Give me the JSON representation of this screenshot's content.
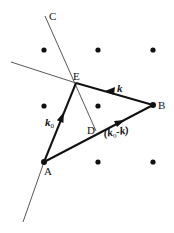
{
  "diagram": {
    "type": "ewald-construction",
    "points": {
      "A": {
        "label": "A",
        "x": 44,
        "y": 162
      },
      "B": {
        "label": "B",
        "x": 153,
        "y": 105
      },
      "C": {
        "label": "C",
        "x": 45,
        "y": 16
      },
      "D": {
        "label": "D",
        "x": 96,
        "y": 131
      },
      "E": {
        "label": "E",
        "x": 76,
        "y": 83
      }
    },
    "lattice_dots": [
      {
        "x": 44,
        "y": 50
      },
      {
        "x": 98,
        "y": 50
      },
      {
        "x": 153,
        "y": 50
      },
      {
        "x": 44,
        "y": 106
      },
      {
        "x": 98,
        "y": 106
      },
      {
        "x": 98,
        "y": 162
      },
      {
        "x": 153,
        "y": 162
      }
    ],
    "vectors": {
      "k0": {
        "label": "k",
        "subscript": "0",
        "from": "A",
        "to": "E"
      },
      "k": {
        "label": "k",
        "from": "B",
        "to": "E"
      },
      "k0_minus_k": {
        "label_open": "(",
        "k0": "k",
        "sub": "o",
        "minus": "-",
        "k": "k",
        "label_close": ")",
        "from": "A",
        "to": "B"
      }
    },
    "labels": {
      "A": "A",
      "B": "B",
      "C": "C",
      "D": "D",
      "E": "E",
      "k": "k",
      "k0_main": "k",
      "k0_sub": "0",
      "diff": "(k",
      "diff_sub": "o",
      "diff_rest": "-k)"
    },
    "colors": {
      "line": "#111111",
      "thin_line": "#444444",
      "dot": "#111111",
      "background": "#ffffff"
    }
  }
}
